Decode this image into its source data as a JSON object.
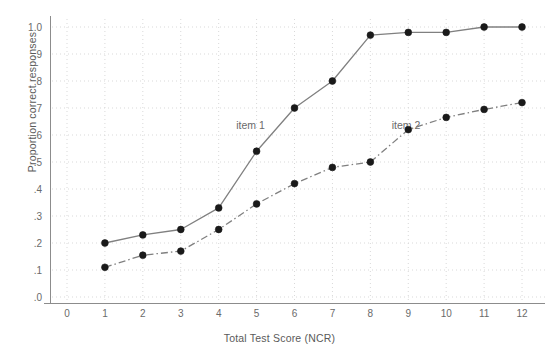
{
  "chart_data": {
    "type": "line",
    "title": "",
    "xlabel": "Total Test Score (NCR)",
    "ylabel": "Proportion correct responses",
    "xlim": [
      0,
      12.6
    ],
    "ylim": [
      0,
      1.05
    ],
    "grid": true,
    "legend_position": "inline-annotation",
    "x": [
      1,
      2,
      3,
      4,
      5,
      6,
      7,
      8,
      9,
      10,
      11,
      12
    ],
    "xticks": [
      "0",
      "1",
      "2",
      "3",
      "4",
      "5",
      "6",
      "7",
      "8",
      "9",
      "10",
      "11",
      "12"
    ],
    "xtick_values": [
      0,
      1,
      2,
      3,
      4,
      5,
      6,
      7,
      8,
      9,
      10,
      11,
      12
    ],
    "yticks": [
      ".0",
      ".1",
      ".2",
      ".3",
      ".4",
      ".5",
      ".6",
      ".7",
      ".8",
      ".9",
      "1.0"
    ],
    "ytick_values": [
      0.0,
      0.1,
      0.2,
      0.3,
      0.4,
      0.5,
      0.6,
      0.7,
      0.8,
      0.9,
      1.0
    ],
    "series": [
      {
        "name": "item 1",
        "linestyle": "solid",
        "color": "#808080",
        "marker": "circle",
        "marker_color": "#1a1a1a",
        "label_x": 5.15,
        "label_y": 0.635,
        "values": [
          0.2,
          0.23,
          0.25,
          0.33,
          0.54,
          0.7,
          0.8,
          0.97,
          0.98,
          0.98,
          1.0,
          1.0
        ]
      },
      {
        "name": "item 2",
        "linestyle": "dashdot",
        "color": "#808080",
        "marker": "circle",
        "marker_color": "#1a1a1a",
        "label_x": 9.25,
        "label_y": 0.635,
        "values": [
          0.11,
          0.155,
          0.17,
          0.25,
          0.345,
          0.42,
          0.48,
          0.5,
          0.62,
          0.665,
          0.695,
          0.72
        ]
      }
    ]
  },
  "axes": {
    "grid_color": "#d9d9d9",
    "axis_color": "#8c8c8c",
    "background": "#ffffff"
  }
}
